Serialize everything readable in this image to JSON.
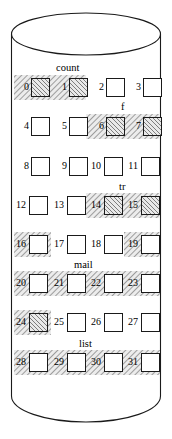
{
  "diagram": {
    "container_shape": "cylinder",
    "block_count": 32,
    "columns": 4,
    "rows": 8,
    "colors": {
      "outline": "#1a1a1a",
      "block_border": "#1a1a1a",
      "block_fill_free": "#ffffff",
      "hatch_stroke": "#3c3c3c",
      "hatch_background": "#e9e9e9",
      "page_background": "#ffffff"
    }
  },
  "blocks": [
    {
      "id": "0",
      "label": "0",
      "hatched": true
    },
    {
      "id": "1",
      "label": "1",
      "hatched": true
    },
    {
      "id": "2",
      "label": "2",
      "hatched": false
    },
    {
      "id": "3",
      "label": "3",
      "hatched": false
    },
    {
      "id": "4",
      "label": "4",
      "hatched": false
    },
    {
      "id": "5",
      "label": "5",
      "hatched": false
    },
    {
      "id": "6",
      "label": "6",
      "hatched": true
    },
    {
      "id": "7",
      "label": "7",
      "hatched": true
    },
    {
      "id": "8",
      "label": "8",
      "hatched": false
    },
    {
      "id": "9",
      "label": "9",
      "hatched": false
    },
    {
      "id": "10",
      "label": "10",
      "hatched": false
    },
    {
      "id": "11",
      "label": "11",
      "hatched": false
    },
    {
      "id": "12",
      "label": "12",
      "hatched": false
    },
    {
      "id": "13",
      "label": "13",
      "hatched": false
    },
    {
      "id": "14",
      "label": "14",
      "hatched": true
    },
    {
      "id": "15",
      "label": "15",
      "hatched": true
    },
    {
      "id": "16",
      "label": "16",
      "hatched": false
    },
    {
      "id": "17",
      "label": "17",
      "hatched": false
    },
    {
      "id": "18",
      "label": "18",
      "hatched": false
    },
    {
      "id": "19",
      "label": "19",
      "hatched": false
    },
    {
      "id": "20",
      "label": "20",
      "hatched": false
    },
    {
      "id": "21",
      "label": "21",
      "hatched": false
    },
    {
      "id": "22",
      "label": "22",
      "hatched": false
    },
    {
      "id": "23",
      "label": "23",
      "hatched": false
    },
    {
      "id": "24",
      "label": "24",
      "hatched": true
    },
    {
      "id": "25",
      "label": "25",
      "hatched": false
    },
    {
      "id": "26",
      "label": "26",
      "hatched": false
    },
    {
      "id": "27",
      "label": "27",
      "hatched": false
    },
    {
      "id": "28",
      "label": "28",
      "hatched": false
    },
    {
      "id": "29",
      "label": "29",
      "hatched": false
    },
    {
      "id": "30",
      "label": "30",
      "hatched": false
    },
    {
      "id": "31",
      "label": "31",
      "hatched": false
    }
  ],
  "region_labels": [
    {
      "id": "count",
      "text": "count"
    },
    {
      "id": "f",
      "text": "f"
    },
    {
      "id": "tr",
      "text": "tr"
    },
    {
      "id": "mail",
      "text": "mail"
    },
    {
      "id": "list",
      "text": "list"
    }
  ]
}
